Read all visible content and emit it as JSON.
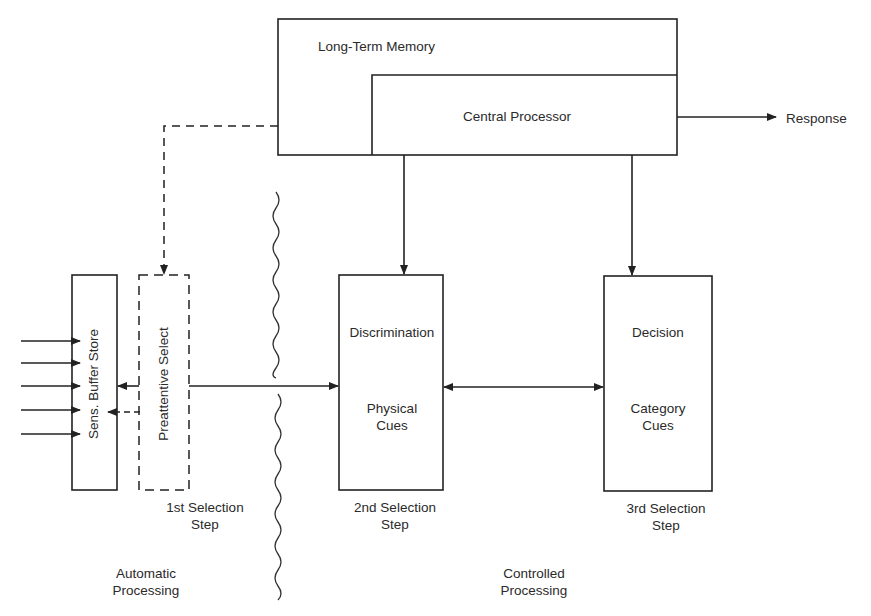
{
  "diagram": {
    "colors": {
      "line": "#222222",
      "background": "#ffffff",
      "text": "#2a2a2a"
    },
    "nodes": {
      "long_term_memory": {
        "label": "Long-Term Memory"
      },
      "central_processor": {
        "label": "Central Processor"
      },
      "response": {
        "label": "Response"
      },
      "sensory_buffer": {
        "label": "Sens. Buffer Store"
      },
      "preattentive": {
        "label": "Preattentive Select",
        "style": "dashed"
      },
      "discrimination": {
        "label_top": "Discrimination",
        "label_bottom_1": "Physical",
        "label_bottom_2": "Cues"
      },
      "decision": {
        "label_top": "Decision",
        "label_bottom_1": "Category",
        "label_bottom_2": "Cues"
      }
    },
    "step_labels": {
      "first": {
        "line1": "1st Selection",
        "line2": "Step"
      },
      "second": {
        "line1": "2nd Selection",
        "line2": "Step"
      },
      "third": {
        "line1": "3rd Selection",
        "line2": "Step"
      }
    },
    "region_labels": {
      "automatic": {
        "line1": "Automatic",
        "line2": "Processing"
      },
      "controlled": {
        "line1": "Controlled",
        "line2": "Processing"
      }
    },
    "edges": [
      {
        "from": "central_processor",
        "to": "response",
        "style": "solid"
      },
      {
        "from": "long_term_memory",
        "to": "preattentive",
        "style": "dashed"
      },
      {
        "from": "central_processor",
        "to": "discrimination",
        "style": "solid"
      },
      {
        "from": "central_processor",
        "to": "decision",
        "style": "solid"
      },
      {
        "from": "preattentive",
        "to": "discrimination",
        "style": "solid"
      },
      {
        "from": "discrimination",
        "to": "decision",
        "style": "solid",
        "bidirectional": true
      },
      {
        "from": "preattentive",
        "to": "sensory_buffer",
        "style": "solid"
      },
      {
        "from": "preattentive",
        "to": "sensory_buffer",
        "style": "dashed"
      },
      {
        "from": "input",
        "to": "sensory_buffer",
        "count": 5,
        "style": "solid"
      }
    ]
  }
}
